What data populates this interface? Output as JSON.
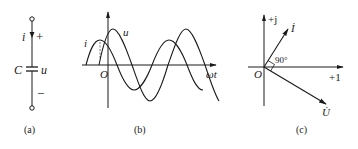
{
  "figure": {
    "panels": [
      {
        "id": "a",
        "caption": "(a)",
        "type": "circuit",
        "labels": {
          "current": "i",
          "plus": "+",
          "minus": "−",
          "capacitor": "C",
          "voltage": "u"
        }
      },
      {
        "id": "b",
        "caption": "(b)",
        "type": "waveform",
        "labels": {
          "origin": "O",
          "x_axis": "ωt",
          "current": "i",
          "voltage": "u"
        }
      },
      {
        "id": "c",
        "caption": "(c)",
        "type": "phasor",
        "labels": {
          "origin": "O",
          "imag_axis": "+j",
          "real_axis": "+1",
          "current_phasor": "İ",
          "voltage_phasor": "U̇",
          "angle": "90°"
        }
      }
    ],
    "colors": {
      "stroke": "#1a1a1a",
      "background": "#ffffff"
    }
  }
}
